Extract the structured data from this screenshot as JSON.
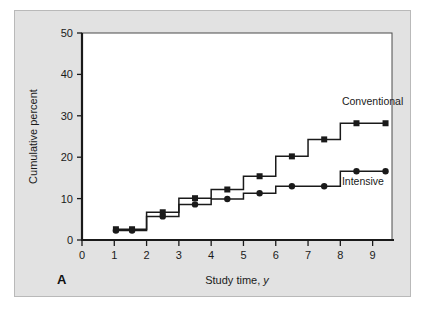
{
  "figure": {
    "panel_letter": "A",
    "background_color": "#e2e2e2",
    "plot_background_color": "#ffffff",
    "axis_color": "#1a1a1a",
    "series_color": "#1a1a1a"
  },
  "chart_data": {
    "type": "line",
    "title": "",
    "subtitle": "",
    "xlabel": "Study time, y",
    "xlabel_plain": "Study time,",
    "xlabel_italic": "y",
    "ylabel": "Cumulative percent",
    "xlim": [
      0,
      9.6
    ],
    "ylim": [
      0,
      50
    ],
    "xticks": [
      0,
      1,
      2,
      3,
      4,
      5,
      6,
      7,
      8,
      9
    ],
    "xtick_labels": [
      "0",
      "1",
      "2",
      "3",
      "4",
      "5",
      "6",
      "7",
      "8",
      "9"
    ],
    "yticks": [
      0,
      10,
      20,
      30,
      40,
      50
    ],
    "ytick_labels": [
      "0",
      "10",
      "20",
      "30",
      "40",
      "50"
    ],
    "grid": false,
    "legend_position": "inline-right",
    "step_style": "post",
    "series": [
      {
        "name": "Conventional",
        "marker": "square",
        "label_x": 8.05,
        "label_y": 32.5,
        "steps": [
          {
            "x": 1.0,
            "y": 2.6
          },
          {
            "x": 2.0,
            "y": 6.7
          },
          {
            "x": 3.0,
            "y": 10.1
          },
          {
            "x": 4.0,
            "y": 12.2
          },
          {
            "x": 5.0,
            "y": 15.4
          },
          {
            "x": 6.0,
            "y": 20.2
          },
          {
            "x": 7.0,
            "y": 24.3
          },
          {
            "x": 8.0,
            "y": 28.2
          },
          {
            "x": 9.45,
            "y": 28.2
          }
        ],
        "markers": [
          {
            "x": 1.05,
            "y": 2.6
          },
          {
            "x": 1.55,
            "y": 2.6
          },
          {
            "x": 2.5,
            "y": 6.7
          },
          {
            "x": 3.5,
            "y": 10.1
          },
          {
            "x": 4.5,
            "y": 12.2
          },
          {
            "x": 5.5,
            "y": 15.4
          },
          {
            "x": 6.5,
            "y": 20.2
          },
          {
            "x": 7.5,
            "y": 24.3
          },
          {
            "x": 8.5,
            "y": 28.2
          },
          {
            "x": 9.4,
            "y": 28.2
          }
        ]
      },
      {
        "name": "Intensive",
        "marker": "circle",
        "label_x": 8.05,
        "label_y": 13.4,
        "steps": [
          {
            "x": 1.0,
            "y": 2.3
          },
          {
            "x": 2.0,
            "y": 5.7
          },
          {
            "x": 3.0,
            "y": 8.6
          },
          {
            "x": 4.0,
            "y": 9.9
          },
          {
            "x": 5.0,
            "y": 11.3
          },
          {
            "x": 6.0,
            "y": 13.0
          },
          {
            "x": 8.0,
            "y": 16.6
          },
          {
            "x": 9.45,
            "y": 16.6
          }
        ],
        "markers": [
          {
            "x": 1.05,
            "y": 2.3
          },
          {
            "x": 1.55,
            "y": 2.3
          },
          {
            "x": 2.5,
            "y": 5.7
          },
          {
            "x": 3.5,
            "y": 8.6
          },
          {
            "x": 4.5,
            "y": 9.9
          },
          {
            "x": 5.5,
            "y": 11.3
          },
          {
            "x": 6.5,
            "y": 13.0
          },
          {
            "x": 7.5,
            "y": 13.0
          },
          {
            "x": 8.5,
            "y": 16.6
          },
          {
            "x": 9.4,
            "y": 16.6
          }
        ]
      }
    ]
  }
}
